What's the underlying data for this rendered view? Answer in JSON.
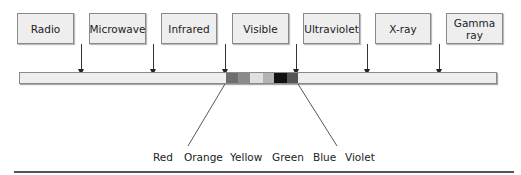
{
  "diagram": {
    "title": "",
    "spectrum_bands": [
      {
        "label": "Radio",
        "box_x": 17,
        "box_w": 57,
        "arrow_x": 81
      },
      {
        "label": "Microwave",
        "box_x": 89,
        "box_w": 57,
        "arrow_x": 153
      },
      {
        "label": "Infrared",
        "box_x": 161,
        "box_w": 56,
        "arrow_x": 225
      },
      {
        "label": "Visible",
        "box_x": 232,
        "box_w": 57,
        "arrow_x": 296
      },
      {
        "label": "Ultraviolet",
        "box_x": 303,
        "box_w": 57,
        "arrow_x": 296
      },
      {
        "label": "X-ray",
        "box_x": 375,
        "box_w": 56,
        "arrow_x": 367
      },
      {
        "label": "Gamma ray",
        "box_x": 446,
        "box_w": 57,
        "arrow_x": 439
      }
    ],
    "visible_segments": [
      {
        "name": "red",
        "x": 206,
        "w": 12,
        "shade": "#6e6e6e"
      },
      {
        "name": "orange",
        "x": 218,
        "w": 12,
        "shade": "#8c8c8c"
      },
      {
        "name": "yellow",
        "x": 230,
        "w": 13,
        "shade": "#e0e0e0"
      },
      {
        "name": "green",
        "x": 243,
        "w": 11,
        "shade": "#b4b4b4"
      },
      {
        "name": "blue",
        "x": 254,
        "w": 13,
        "shade": "#111111"
      },
      {
        "name": "violet",
        "x": 267,
        "w": 11,
        "shade": "#555555"
      }
    ],
    "color_labels": [
      {
        "label": "Red",
        "x": 153
      },
      {
        "label": "Orange",
        "x": 184
      },
      {
        "label": "Yellow",
        "x": 230
      },
      {
        "label": "Green",
        "x": 272
      },
      {
        "label": "Blue",
        "x": 313
      },
      {
        "label": "Violet",
        "x": 345
      }
    ]
  }
}
